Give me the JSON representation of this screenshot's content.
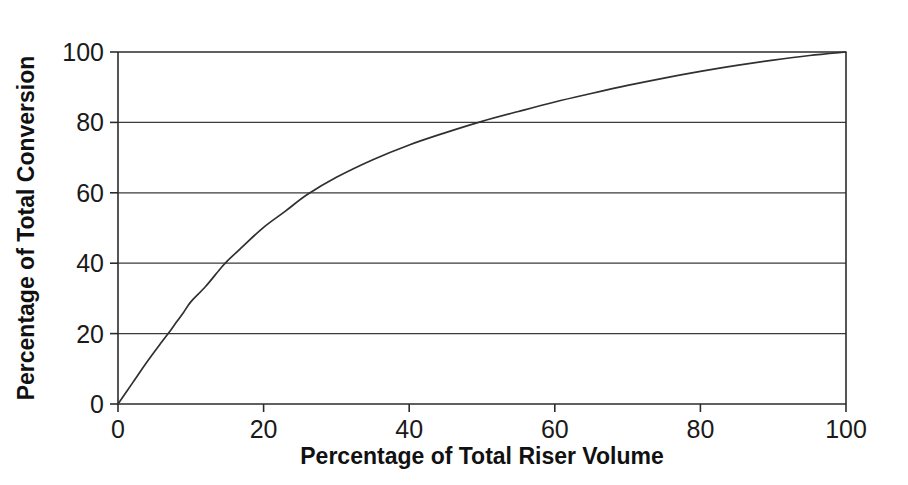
{
  "chart_data": {
    "type": "line",
    "title": "",
    "xlabel": "Percentage of Total Riser Volume",
    "ylabel": "Percentage of Total Conversion",
    "xlim": [
      0,
      100
    ],
    "ylim": [
      0,
      100
    ],
    "xticks": [
      0,
      20,
      40,
      60,
      80,
      100
    ],
    "yticks": [
      0,
      20,
      40,
      60,
      80,
      100
    ],
    "xtick_labels": [
      "0",
      "20",
      "40",
      "60",
      "80",
      "100"
    ],
    "ytick_labels": [
      "0",
      "20",
      "40",
      "60",
      "80",
      "100"
    ],
    "grid": "horizontal",
    "gridlines_y": [
      20,
      40,
      60,
      80
    ],
    "legend": "none",
    "series": [
      {
        "name": "Conversion vs riser volume",
        "x": [
          0,
          2,
          4,
          6,
          7,
          8,
          9,
          10,
          12,
          14,
          15,
          17,
          20,
          23,
          26,
          30,
          35,
          40,
          45,
          50,
          55,
          60,
          65,
          70,
          75,
          80,
          85,
          90,
          95,
          100
        ],
        "y": [
          0,
          6,
          12,
          17.6,
          20.3,
          23.2,
          26,
          29,
          33.3,
          38.3,
          40.6,
          44.5,
          50.2,
          54.8,
          59.5,
          64.4,
          69.4,
          73.6,
          77.1,
          80.3,
          83.1,
          85.8,
          88.2,
          90.5,
          92.6,
          94.5,
          96.2,
          97.7,
          99,
          100
        ]
      }
    ],
    "annotations": [
      {
        "text": "curve passes through y=20 at x≈7",
        "x": 7,
        "y": 20
      },
      {
        "text": "curve passes through y=40 at x≈15",
        "x": 15,
        "y": 40
      },
      {
        "text": "curve passes through y=60 at x≈26",
        "x": 26,
        "y": 60
      },
      {
        "text": "curve passes through y=80 at x≈50",
        "x": 50,
        "y": 80
      },
      {
        "text": "curve reaches y=100 at x=100",
        "x": 100,
        "y": 100
      }
    ],
    "colors": {
      "background": "#ffffff",
      "curve": "#303030",
      "axis": "#2b2b2b",
      "grid": "#3a3a3a",
      "text": "#1a1a1a"
    }
  }
}
